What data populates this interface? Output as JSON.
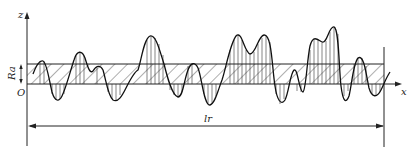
{
  "figure": {
    "axes": {
      "z_label": "z",
      "x_label": "x",
      "origin_label": "O"
    },
    "band": {
      "label": "Ra",
      "description": "Hatched band between mean line and Ra line"
    },
    "dimension": {
      "label": "lr",
      "description": "Sampling length"
    },
    "colors": {
      "line": "#222222",
      "background": "#ffffff"
    }
  }
}
